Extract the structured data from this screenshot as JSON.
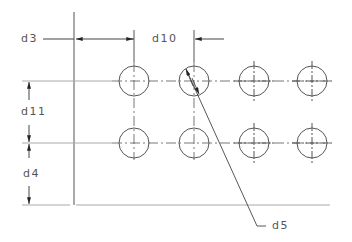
{
  "drawing": {
    "title": "Hole pattern dimension drawing",
    "labels": {
      "d3": "d3",
      "d10": "d10",
      "d11": "d11",
      "d4": "d4",
      "d5": "d5"
    },
    "grid": {
      "columns": [
        134,
        194,
        254,
        312
      ],
      "rows": [
        81,
        143
      ],
      "hole_radius": 15
    },
    "colors": {
      "line": "#444444",
      "extension": "#999999",
      "text": "#555555"
    }
  }
}
